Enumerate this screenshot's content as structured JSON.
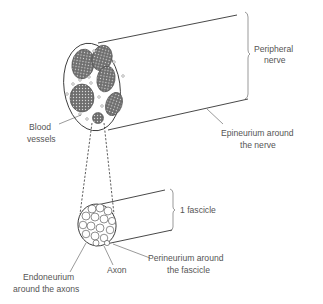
{
  "diagram": {
    "type": "anatomical-diagram",
    "labels": {
      "peripheral_nerve_line1": "Peripheral",
      "peripheral_nerve_line2": "nerve",
      "blood_vessels_line1": "Blood",
      "blood_vessels_line2": "vessels",
      "epineurium_line1": "Epineurium around",
      "epineurium_line2": "the nerve",
      "fascicle": "1 fascicle",
      "perineurium_line1": "Perineurium around",
      "perineurium_line2": "the fascicle",
      "axon": "Axon",
      "endoneurium_line1": "Endoneurium",
      "endoneurium_line2": "around the axons"
    },
    "colors": {
      "stroke": "#333333",
      "label_text": "#555555",
      "fascicle_fill": "#7a7a7a",
      "background": "#ffffff"
    }
  }
}
